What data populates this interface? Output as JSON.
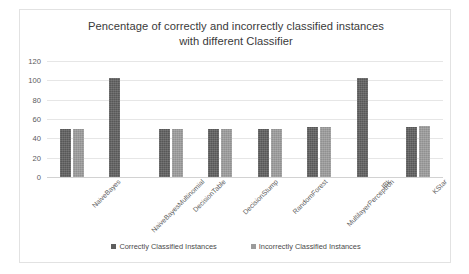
{
  "chart_data": {
    "type": "bar",
    "title": "Pencentage of correctly and incorrectly classified instances\nwith different Classifier",
    "xlabel": "",
    "ylabel": "",
    "ylim": [
      0,
      120
    ],
    "yticks": [
      0,
      20,
      40,
      60,
      80,
      100,
      120
    ],
    "grid": true,
    "legend_position": "bottom",
    "categories": [
      "NaiveBayes",
      "NaiveBayesMultinomial",
      "DecisionTable",
      "DecisionStump",
      "RandomForest",
      "MultilayerPerceptron",
      "IBk",
      "KStar"
    ],
    "series": [
      {
        "name": "Correctly Classified Instances",
        "color": "#5e5e5e",
        "values": [
          50,
          102,
          50,
          50,
          50,
          52,
          102,
          52
        ]
      },
      {
        "name": "Incorrectly Classified Instances",
        "color": "#9b9b9b",
        "values": [
          50,
          0,
          50,
          50,
          50,
          52,
          0,
          53
        ]
      }
    ]
  },
  "frame": {
    "border_color": "#e2e2e2",
    "background": "#ffffff"
  }
}
